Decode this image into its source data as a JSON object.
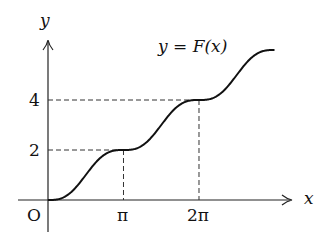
{
  "chart_data": {
    "type": "line",
    "title": "y = F(x)",
    "xlabel": "x",
    "ylabel": "y",
    "origin_label": "O",
    "x_ticks": [
      {
        "value": 3.14159,
        "label": "π"
      },
      {
        "value": 6.28318,
        "label": "2π"
      }
    ],
    "y_ticks": [
      {
        "value": 2,
        "label": "2"
      },
      {
        "value": 4,
        "label": "4"
      }
    ],
    "series": [
      {
        "name": "F(x)",
        "points": [
          [
            0,
            0
          ],
          [
            1.5708,
            1
          ],
          [
            3.14159,
            2
          ],
          [
            4.7124,
            3
          ],
          [
            6.28318,
            4
          ],
          [
            7.854,
            5
          ],
          [
            9.4248,
            6
          ]
        ]
      }
    ],
    "guides": [
      {
        "x": 3.14159,
        "y": 2
      },
      {
        "x": 6.28318,
        "y": 4
      }
    ],
    "grid": false
  },
  "labels": {
    "y_axis": "y",
    "x_axis": "x",
    "origin": "O",
    "func_lhs": "y",
    "func_eq": " = ",
    "func_rhs": "F(x)",
    "tick_pi": "π",
    "tick_2pi": "2π",
    "tick_2": "2",
    "tick_4": "4"
  }
}
